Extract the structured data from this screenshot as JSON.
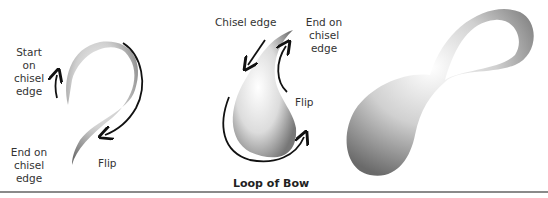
{
  "figure1": {
    "start_label": [
      "Start on",
      "chisel",
      "edge"
    ],
    "end_label": [
      "End on",
      "chisel",
      "edge"
    ],
    "flip_label": "Flip"
  },
  "figure2": {
    "chisel_label": "Chisel edge",
    "end_label": [
      "End on",
      "chisel",
      "edge"
    ],
    "flip_label": "Flip",
    "caption": "Loop of Bow"
  },
  "figure3": {
    "description": "Completed bow stroke (figure-eight)"
  },
  "colors": {
    "stroke_dark": "#5a5a5a",
    "stroke_light": "#d8d8d8",
    "arrow": "#111111",
    "rule": "#8a8a8a"
  }
}
